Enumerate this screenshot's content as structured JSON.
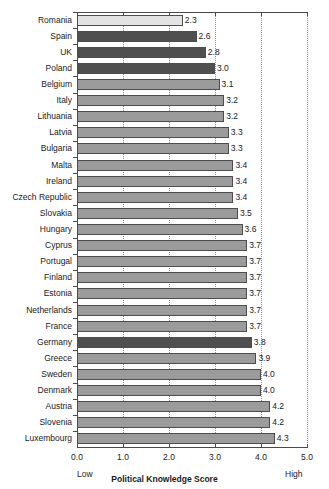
{
  "chart_data": {
    "type": "bar",
    "orientation": "horizontal",
    "title": "",
    "xlabel": "Political Knowledge Score",
    "ylabel": "",
    "xlim": [
      0.0,
      5.0
    ],
    "xticks": [
      "0.0",
      "1.0",
      "2.0",
      "3.0",
      "4.0",
      "5.0"
    ],
    "xtick_values": [
      0.0,
      1.0,
      2.0,
      3.0,
      4.0,
      5.0
    ],
    "grid": "vertical-dotted",
    "legend": "none",
    "low_anchor": "Low",
    "high_anchor": "High",
    "categories": [
      "Romania",
      "Spain",
      "UK",
      "Poland",
      "Belgium",
      "Italy",
      "Lithuania",
      "Latvia",
      "Bulgaria",
      "Malta",
      "Ireland",
      "Czech Republic",
      "Slovakia",
      "Hungary",
      "Cyprus",
      "Portugal",
      "Finland",
      "Estonia",
      "Netherlands",
      "France",
      "Germany",
      "Greece",
      "Sweden",
      "Denmark",
      "Austria",
      "Slovenia",
      "Luxembourg"
    ],
    "values": [
      2.3,
      2.6,
      2.8,
      3.0,
      3.1,
      3.2,
      3.2,
      3.3,
      3.3,
      3.4,
      3.4,
      3.4,
      3.5,
      3.6,
      3.7,
      3.7,
      3.7,
      3.7,
      3.7,
      3.7,
      3.8,
      3.9,
      4.0,
      4.0,
      4.2,
      4.2,
      4.3
    ],
    "value_labels": [
      "2.3",
      "2.6",
      "2.8",
      "3.0",
      "3.1",
      "3.2",
      "3.2",
      "3.3",
      "3.3",
      "3.4",
      "3.4",
      "3.4",
      "3.5",
      "3.6",
      "3.7",
      "3.7",
      "3.7",
      "3.7",
      "3.7",
      "3.7",
      "3.8",
      "3.9",
      "4.0",
      "4.0",
      "4.2",
      "4.2",
      "4.3"
    ],
    "bar_shades": [
      "light",
      "dark",
      "dark",
      "dark",
      "medium",
      "medium",
      "medium",
      "medium",
      "medium",
      "medium",
      "medium",
      "medium",
      "medium",
      "medium",
      "medium",
      "medium",
      "medium",
      "medium",
      "medium",
      "medium",
      "dark",
      "medium",
      "medium",
      "medium",
      "medium",
      "medium",
      "medium"
    ],
    "colors": {
      "light": "#e3e3e3",
      "medium": "#9b9b9b",
      "dark": "#4f4f4f",
      "bar_border": "#4d4d4d",
      "axis": "#4a4a4a",
      "gridline": "#8e8e8e",
      "text": "#1a1a1a",
      "background": "#ffffff"
    }
  }
}
